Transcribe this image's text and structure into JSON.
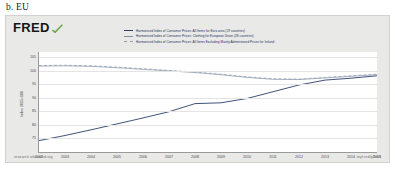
{
  "figure": {
    "caption": "b. EU"
  },
  "brand": {
    "logo_text": "FRED",
    "swoosh_color": "#6aa84f"
  },
  "footer": {
    "left": "research.stlouisfed.org",
    "right": "myf.red/g/fvb8"
  },
  "chart_data": {
    "type": "line",
    "title": "",
    "xlabel": "",
    "ylabel": "Index 2015=100",
    "xlim": [
      2002,
      2015
    ],
    "ylim": [
      70,
      107
    ],
    "grid": true,
    "legend_position": "top",
    "x": [
      2002,
      2003,
      2004,
      2005,
      2006,
      2007,
      2008,
      2009,
      2010,
      2011,
      2012,
      2013,
      2014,
      2015
    ],
    "yticks": [
      105,
      100,
      95,
      90,
      85,
      80,
      75
    ],
    "xticks": [
      2002,
      2003,
      2004,
      2005,
      2006,
      2007,
      2008,
      2009,
      2010,
      2011,
      2012,
      2013,
      2014,
      2015
    ],
    "series": [
      {
        "name": "Harmonized Index of Consumer Prices: All Items for Euro area (19 countries)",
        "color": "#2d3e6b",
        "style": "solid",
        "values": [
          74.2,
          76.1,
          78.2,
          80.4,
          82.6,
          84.9,
          87.9,
          88.2,
          89.8,
          92.3,
          94.8,
          96.6,
          97.3,
          98.2
        ]
      },
      {
        "name": "Harmonized Index of Consumer Prices: Clothing for European Union (28 countries)",
        "color": "#7f8fa6",
        "style": "solid",
        "values": [
          101.8,
          101.9,
          101.7,
          101.2,
          100.6,
          100.0,
          99.4,
          98.6,
          97.6,
          96.9,
          96.8,
          97.4,
          98.0,
          98.6
        ]
      },
      {
        "name": "Harmonized Index of Consumer Prices: All Items Excluding Mainly Administered Prices for Ireland",
        "color": "#8f9bb3",
        "style": "dashed",
        "values": [
          102.0,
          102.1,
          101.9,
          101.4,
          100.8,
          100.2,
          99.6,
          98.8,
          97.8,
          97.1,
          97.0,
          97.6,
          98.2,
          98.8
        ]
      }
    ]
  }
}
